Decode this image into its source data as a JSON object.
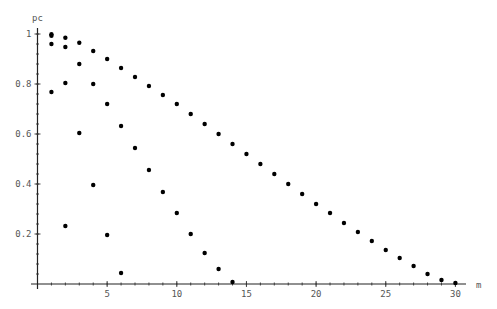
{
  "chart_data": {
    "type": "scatter",
    "title": "",
    "xlabel": "m",
    "ylabel": "pc",
    "xlim": [
      0,
      30.5
    ],
    "ylim": [
      0,
      1.03
    ],
    "grid": false,
    "legend": null,
    "x_ticks": [
      5,
      10,
      15,
      20,
      25,
      30
    ],
    "x_tick_labels": [
      "5",
      "10",
      "15",
      "20",
      "25",
      "30"
    ],
    "y_ticks": [
      0.2,
      0.4,
      0.6,
      0.8,
      1
    ],
    "y_tick_labels": [
      "0.2",
      "0.4",
      "0.6",
      "0.8",
      "1"
    ],
    "series": [
      {
        "name": "series-1",
        "x": [
          1,
          2,
          3,
          4,
          5,
          6,
          7,
          8,
          9,
          10,
          11,
          12,
          13,
          14,
          15,
          16,
          17,
          18,
          19,
          20,
          21,
          22,
          23,
          24,
          25,
          26,
          27,
          28,
          29,
          30
        ],
        "values": [
          0.999,
          0.985,
          0.965,
          0.932,
          0.9,
          0.864,
          0.828,
          0.792,
          0.756,
          0.72,
          0.68,
          0.64,
          0.6,
          0.56,
          0.52,
          0.48,
          0.44,
          0.4,
          0.36,
          0.32,
          0.284,
          0.244,
          0.208,
          0.172,
          0.136,
          0.104,
          0.072,
          0.04,
          0.016,
          0.004
        ]
      },
      {
        "name": "series-2",
        "x": [
          1,
          2,
          3,
          4,
          5,
          6,
          7,
          8,
          9,
          10,
          11,
          12,
          13,
          14
        ],
        "values": [
          0.96,
          0.948,
          0.88,
          0.8,
          0.72,
          0.632,
          0.544,
          0.456,
          0.368,
          0.284,
          0.2,
          0.124,
          0.06,
          0.008
        ]
      },
      {
        "name": "series-3",
        "x": [
          1,
          2,
          3,
          4,
          5,
          6
        ],
        "values": [
          0.768,
          0.804,
          0.604,
          0.396,
          0.196,
          0.044
        ]
      },
      {
        "name": "series-4",
        "x": [
          1,
          2
        ],
        "values": [
          0.993,
          0.232
        ]
      }
    ]
  }
}
